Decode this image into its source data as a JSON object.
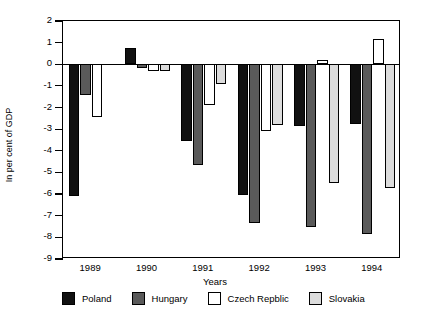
{
  "chart_data": {
    "type": "bar",
    "title": "",
    "xlabel": "Years",
    "ylabel": "In per cent of GDP",
    "categories": [
      "1989",
      "1990",
      "1991",
      "1992",
      "1993",
      "1994"
    ],
    "ylim": [
      -9,
      2
    ],
    "ytick_labels": [
      "2",
      "1",
      "0",
      "-1",
      "-2",
      "-3",
      "-4",
      "-5",
      "-6",
      "-7",
      "-8",
      "-9"
    ],
    "ytick_values": [
      2,
      1,
      0,
      -1,
      -2,
      -3,
      -4,
      -5,
      -6,
      -7,
      -8,
      -9
    ],
    "grid": false,
    "legend_position": "below",
    "series": [
      {
        "name": "Poland",
        "color": "#111111",
        "values": [
          -6.1,
          0.75,
          -3.55,
          -6.05,
          -2.85,
          -2.75
        ]
      },
      {
        "name": "Hungary",
        "color": "#5a5a5a",
        "values": [
          -1.4,
          -0.15,
          -4.65,
          -7.35,
          -7.5,
          -7.85
        ]
      },
      {
        "name": "Czech Repblic",
        "color": "#ffffff",
        "values": [
          -2.45,
          -0.3,
          -1.9,
          -3.1,
          0.2,
          1.15
        ]
      },
      {
        "name": "Slovakia",
        "color": "#dcdcdc",
        "values": [
          null,
          -0.3,
          -0.9,
          -2.8,
          -5.5,
          -5.7
        ]
      }
    ]
  },
  "legend": {
    "items": [
      {
        "label": "Poland",
        "key": "poland"
      },
      {
        "label": "Hungary",
        "key": "hungary"
      },
      {
        "label": "Czech Repblic",
        "key": "czech"
      },
      {
        "label": "Slovakia",
        "key": "slovakia"
      }
    ]
  },
  "axes": {
    "y_title": "In per cent of GDP",
    "x_title": "Years"
  }
}
